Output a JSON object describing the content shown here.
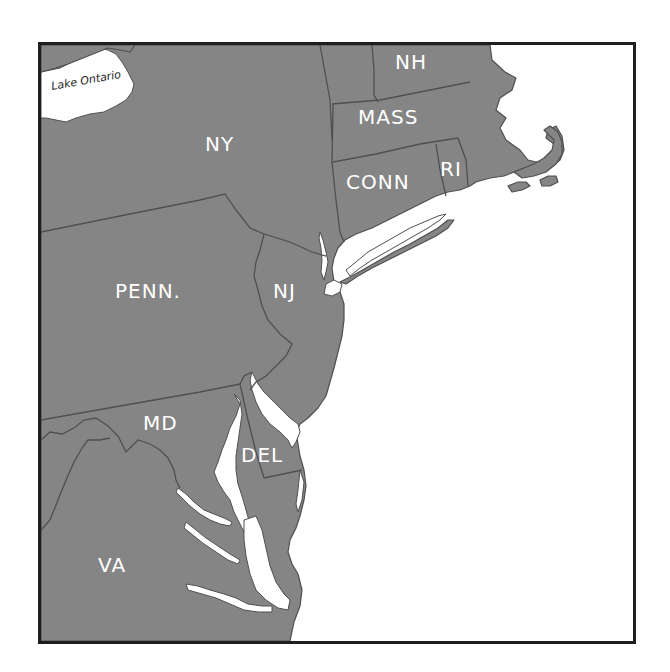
{
  "map": {
    "colors": {
      "land": "#858585",
      "border": "#505050",
      "water": "#ffffff",
      "frame": "#1e1e1e",
      "label": "#ffffff"
    },
    "water_labels": {
      "lake_ontario": "Lake Ontario"
    },
    "state_labels": {
      "ny": "NY",
      "nh": "NH",
      "mass": "MASS",
      "conn": "CONN",
      "ri": "RI",
      "penn": "PENN.",
      "nj": "NJ",
      "md": "MD",
      "del": "DEL",
      "va": "VA"
    }
  }
}
